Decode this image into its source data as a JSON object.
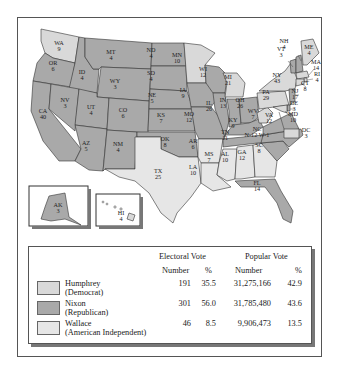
{
  "colors": {
    "nixon": "#a9a9a9",
    "humphrey": "#d9d9d9",
    "wallace": "#e6e6e6",
    "border": "#333333"
  },
  "states": [
    {
      "abbr": "WA",
      "ev": "9",
      "winner": "humphrey"
    },
    {
      "abbr": "OR",
      "ev": "6",
      "winner": "nixon"
    },
    {
      "abbr": "CA",
      "ev": "40",
      "winner": "nixon"
    },
    {
      "abbr": "ID",
      "ev": "4",
      "winner": "nixon"
    },
    {
      "abbr": "NV",
      "ev": "3",
      "winner": "nixon"
    },
    {
      "abbr": "MT",
      "ev": "4",
      "winner": "nixon"
    },
    {
      "abbr": "WY",
      "ev": "3",
      "winner": "nixon"
    },
    {
      "abbr": "UT",
      "ev": "4",
      "winner": "nixon"
    },
    {
      "abbr": "AZ",
      "ev": "5",
      "winner": "nixon"
    },
    {
      "abbr": "CO",
      "ev": "6",
      "winner": "nixon"
    },
    {
      "abbr": "NM",
      "ev": "4",
      "winner": "nixon"
    },
    {
      "abbr": "ND",
      "ev": "4",
      "winner": "nixon"
    },
    {
      "abbr": "SD",
      "ev": "4",
      "winner": "nixon"
    },
    {
      "abbr": "NE",
      "ev": "5",
      "winner": "nixon"
    },
    {
      "abbr": "KS",
      "ev": "7",
      "winner": "nixon"
    },
    {
      "abbr": "OK",
      "ev": "8",
      "winner": "nixon"
    },
    {
      "abbr": "TX",
      "ev": "25",
      "winner": "humphrey"
    },
    {
      "abbr": "MN",
      "ev": "10",
      "winner": "humphrey"
    },
    {
      "abbr": "IA",
      "ev": "9",
      "winner": "nixon"
    },
    {
      "abbr": "MO",
      "ev": "12",
      "winner": "nixon"
    },
    {
      "abbr": "AR",
      "ev": "6",
      "winner": "wallace"
    },
    {
      "abbr": "LA",
      "ev": "10",
      "winner": "wallace"
    },
    {
      "abbr": "WI",
      "ev": "12",
      "winner": "nixon"
    },
    {
      "abbr": "IL",
      "ev": "26",
      "winner": "nixon"
    },
    {
      "abbr": "MS",
      "ev": "7",
      "winner": "wallace"
    },
    {
      "abbr": "MI",
      "ev": "21",
      "winner": "humphrey"
    },
    {
      "abbr": "IN",
      "ev": "13",
      "winner": "nixon"
    },
    {
      "abbr": "OH",
      "ev": "26",
      "winner": "nixon"
    },
    {
      "abbr": "KY",
      "ev": "9",
      "winner": "nixon"
    },
    {
      "abbr": "TN",
      "ev": "11",
      "winner": "nixon"
    },
    {
      "abbr": "AL",
      "ev": "10",
      "winner": "wallace"
    },
    {
      "abbr": "GA",
      "ev": "12",
      "winner": "wallace"
    },
    {
      "abbr": "FL",
      "ev": "14",
      "winner": "nixon"
    },
    {
      "abbr": "SC",
      "ev": "8",
      "winner": "nixon"
    },
    {
      "abbr": "NC",
      "ev": "N-12 W-1",
      "winner": "nixon"
    },
    {
      "abbr": "VA",
      "ev": "12",
      "winner": "nixon"
    },
    {
      "abbr": "WV",
      "ev": "7",
      "winner": "humphrey"
    },
    {
      "abbr": "PA",
      "ev": "29",
      "winner": "humphrey"
    },
    {
      "abbr": "NY",
      "ev": "43",
      "winner": "humphrey"
    },
    {
      "abbr": "VT",
      "ev": "3",
      "winner": "nixon"
    },
    {
      "abbr": "NH",
      "ev": "4",
      "winner": "nixon"
    },
    {
      "abbr": "ME",
      "ev": "4",
      "winner": "humphrey"
    },
    {
      "abbr": "MA",
      "ev": "14",
      "winner": "humphrey"
    },
    {
      "abbr": "RI",
      "ev": "4",
      "winner": "humphrey"
    },
    {
      "abbr": "CT",
      "ev": "8",
      "winner": "humphrey"
    },
    {
      "abbr": "NJ",
      "ev": "17",
      "winner": "nixon"
    },
    {
      "abbr": "DE",
      "ev": "3",
      "winner": "nixon"
    },
    {
      "abbr": "MD",
      "ev": "10",
      "winner": "humphrey"
    },
    {
      "abbr": "DC",
      "ev": "3",
      "winner": "humphrey"
    },
    {
      "abbr": "AK",
      "ev": "3",
      "winner": "nixon"
    },
    {
      "abbr": "HI",
      "ev": "4",
      "winner": "humphrey"
    }
  ],
  "legend": {
    "header_electoral": "Electoral Vote",
    "header_popular": "Popular Vote",
    "sub_number_ev": "Number",
    "sub_pct_ev": "%",
    "sub_number_pop": "Number",
    "sub_pct_pop": "%",
    "rows": [
      {
        "name": "Humphrey",
        "party": "(Democrat)",
        "ev": "191",
        "ev_pct": "35.5",
        "pop": "31,275,166",
        "pop_pct": "42.9",
        "color_key": "humphrey"
      },
      {
        "name": "Nixon",
        "party": "(Republican)",
        "ev": "301",
        "ev_pct": "56.0",
        "pop": "31,785,480",
        "pop_pct": "43.6",
        "color_key": "nixon"
      },
      {
        "name": "Wallace",
        "party": "(American Independent)",
        "ev": "46",
        "ev_pct": "8.5",
        "pop": "9,906,473",
        "pop_pct": "13.5",
        "color_key": "wallace"
      }
    ]
  }
}
